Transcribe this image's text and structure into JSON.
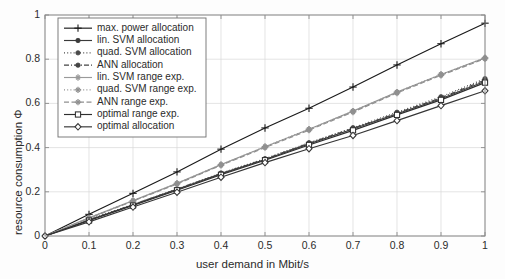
{
  "chart_data": {
    "type": "line",
    "title": "",
    "xlabel": "user demand in Mbit/s",
    "ylabel": "resource consumption Φ",
    "xlim": [
      0,
      1
    ],
    "ylim": [
      0,
      1
    ],
    "grid": true,
    "legend_position": "upper-left",
    "x": [
      0,
      0.1,
      0.2,
      0.3,
      0.4,
      0.5,
      0.6,
      0.7,
      0.8,
      0.9,
      1.0
    ],
    "xticks": [
      "0",
      "0.1",
      "0.2",
      "0.3",
      "0.4",
      "0.5",
      "0.6",
      "0.7",
      "0.8",
      "0.9",
      "1"
    ],
    "yticks": [
      "0",
      "0.2",
      "0.4",
      "0.6",
      "0.8",
      "1"
    ],
    "series": [
      {
        "name": "max. power allocation",
        "marker": "plus",
        "linestyle": "solid",
        "color": "#1a1a1a",
        "values": [
          0,
          0.098,
          0.193,
          0.29,
          0.393,
          0.489,
          0.578,
          0.674,
          0.774,
          0.87,
          0.963
        ]
      },
      {
        "name": "lin. SVM allocation",
        "marker": "circle",
        "linestyle": "solid",
        "color": "#3a3a3a",
        "values": [
          0,
          0.072,
          0.141,
          0.211,
          0.281,
          0.346,
          0.417,
          0.484,
          0.553,
          0.621,
          0.7
        ]
      },
      {
        "name": "quad. SVM allocation",
        "marker": "circle",
        "linestyle": "dotted",
        "color": "#4a4a4a",
        "values": [
          0,
          0.074,
          0.143,
          0.213,
          0.285,
          0.35,
          0.422,
          0.49,
          0.56,
          0.63,
          0.712
        ]
      },
      {
        "name": "ANN allocation",
        "marker": "circle",
        "linestyle": "dashdot",
        "color": "#444444",
        "values": [
          0,
          0.073,
          0.142,
          0.212,
          0.283,
          0.348,
          0.42,
          0.487,
          0.556,
          0.625,
          0.706
        ]
      },
      {
        "name": "lin. SVM range exp.",
        "marker": "star",
        "linestyle": "solid",
        "color": "#9a9a9a",
        "values": [
          0,
          0.082,
          0.16,
          0.238,
          0.323,
          0.404,
          0.483,
          0.565,
          0.651,
          0.731,
          0.806
        ]
      },
      {
        "name": "quad. SVM range exp.",
        "marker": "star",
        "linestyle": "dotted",
        "color": "#8f8f8f",
        "values": [
          0,
          0.082,
          0.16,
          0.238,
          0.323,
          0.404,
          0.483,
          0.565,
          0.651,
          0.731,
          0.806
        ]
      },
      {
        "name": "ANN range exp.",
        "marker": "star",
        "linestyle": "dashed",
        "color": "#909090",
        "values": [
          0,
          0.08,
          0.158,
          0.235,
          0.32,
          0.4,
          0.479,
          0.561,
          0.647,
          0.727,
          0.802
        ]
      },
      {
        "name": "optimal range exp.",
        "marker": "square",
        "linestyle": "solid",
        "color": "#2e2e2e",
        "values": [
          0,
          0.07,
          0.138,
          0.207,
          0.277,
          0.343,
          0.412,
          0.478,
          0.548,
          0.616,
          0.694
        ]
      },
      {
        "name": "optimal allocation",
        "marker": "diamond",
        "linestyle": "solid",
        "color": "#353535",
        "values": [
          0,
          0.064,
          0.131,
          0.198,
          0.266,
          0.332,
          0.395,
          0.455,
          0.522,
          0.59,
          0.657
        ]
      }
    ]
  },
  "colors": {
    "axis": "#8a8a8a",
    "grid": "#d8d8d8",
    "text": "#2b2b2b",
    "legend_border": "#6f6f6f",
    "background": "#fdfdfd"
  }
}
